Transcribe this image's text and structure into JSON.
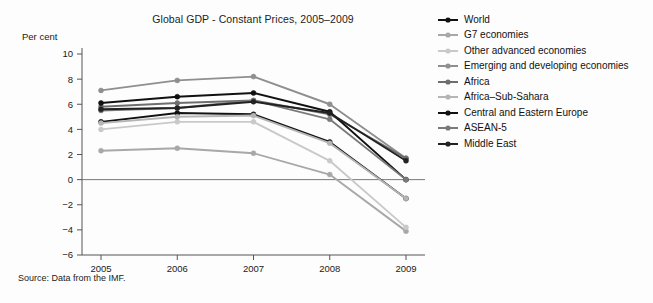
{
  "chart_data": {
    "type": "line",
    "title": "Global GDP - Constant Prices, 2005–2009",
    "xlabel": "",
    "ylabel": "Per cent",
    "categories": [
      "2005",
      "2006",
      "2007",
      "2008",
      "2009"
    ],
    "x": [
      2005,
      2006,
      2007,
      2008,
      2009
    ],
    "ylim": [
      -6,
      10
    ],
    "yticks": [
      -6,
      -4,
      -2,
      0,
      2,
      4,
      6,
      8,
      10
    ],
    "ytick_labels": [
      "−6",
      "−4",
      "−2",
      "0",
      "2",
      "4",
      "6",
      "8",
      "10"
    ],
    "grid": false,
    "legend_position": "right",
    "markers": true,
    "source": "Source: Data from the IMF.",
    "series": [
      {
        "name": "World",
        "color": "#111111",
        "values": [
          4.6,
          5.3,
          5.2,
          3.0,
          -1.5
        ]
      },
      {
        "name": "G7 economies",
        "color": "#a8a8a8",
        "values": [
          2.3,
          2.5,
          2.1,
          0.4,
          -4.1
        ]
      },
      {
        "name": "Other advanced economies",
        "color": "#c9c9c9",
        "values": [
          4.0,
          4.6,
          4.6,
          1.5,
          -3.8
        ]
      },
      {
        "name": "Emerging and developing economies",
        "color": "#8f8f8f",
        "values": [
          7.1,
          7.9,
          8.2,
          6.0,
          1.7
        ]
      },
      {
        "name": "Africa",
        "color": "#6e6e6e",
        "values": [
          5.8,
          6.1,
          6.3,
          5.2,
          1.7
        ]
      },
      {
        "name": "Africa–Sub-Sahara",
        "color": "#b5b5b5",
        "values": [
          4.5,
          5.0,
          5.1,
          2.9,
          -1.5
        ]
      },
      {
        "name": "Central and Eastern Europe",
        "color": "#111111",
        "values": [
          6.1,
          6.6,
          6.9,
          5.4,
          0.0
        ]
      },
      {
        "name": "ASEAN-5",
        "color": "#7a7a7a",
        "values": [
          5.5,
          5.7,
          6.3,
          4.8,
          0.0
        ]
      },
      {
        "name": "Middle East",
        "color": "#222222",
        "values": [
          5.6,
          5.7,
          6.2,
          5.3,
          1.5
        ]
      }
    ]
  },
  "legend": {
    "items": [
      "World",
      "G7 economies",
      "Other advanced economies",
      "Emerging and developing economies",
      "Africa",
      "Africa–Sub-Sahara",
      "Central and Eastern Europe",
      "ASEAN-5",
      "Middle East"
    ]
  }
}
